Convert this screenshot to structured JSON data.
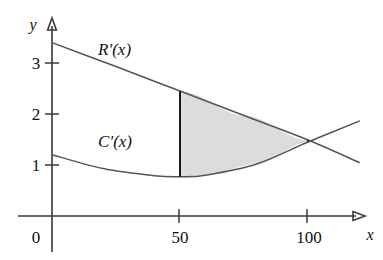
{
  "figure": {
    "title": "",
    "axis_labels": {
      "x": "x",
      "y": "y"
    },
    "origin_label": "0",
    "y_ticks": [
      {
        "value": 1,
        "label": "1"
      },
      {
        "value": 2,
        "label": "2"
      },
      {
        "value": 3,
        "label": "3"
      }
    ],
    "x_ticks": [
      {
        "value": 50,
        "label": "50"
      },
      {
        "value": 100,
        "label": "100"
      }
    ],
    "curve_labels": {
      "revenue": "R′(x)",
      "cost": "C′(x)"
    },
    "shading_color": "#dcdcdc",
    "curve_color": "#555555",
    "axis_color": "#3a3a3a"
  },
  "chart_data": {
    "type": "line",
    "title": "",
    "xlabel": "x",
    "ylabel": "y",
    "xlim": [
      0,
      120
    ],
    "ylim": [
      0,
      4
    ],
    "grid": false,
    "legend": "inline-curve-labels",
    "xticks": [
      0,
      50,
      100
    ],
    "xticklabels": [
      "0",
      "50",
      "100"
    ],
    "yticks": [
      1,
      2,
      3
    ],
    "yticklabels": [
      "1",
      "2",
      "3"
    ],
    "series": [
      {
        "name": "R′(x)",
        "label_position": {
          "x": 18,
          "y": 3.15
        },
        "points": [
          {
            "x": 0,
            "y": 3.4
          },
          {
            "x": 25,
            "y": 2.93
          },
          {
            "x": 50,
            "y": 2.45
          },
          {
            "x": 75,
            "y": 1.97
          },
          {
            "x": 100,
            "y": 1.49
          },
          {
            "x": 120,
            "y": 1.05
          }
        ]
      },
      {
        "name": "C′(x)",
        "label_position": {
          "x": 18,
          "y": 1.35
        },
        "points": [
          {
            "x": 0,
            "y": 1.2
          },
          {
            "x": 20,
            "y": 0.93
          },
          {
            "x": 40,
            "y": 0.79
          },
          {
            "x": 50,
            "y": 0.77
          },
          {
            "x": 60,
            "y": 0.8
          },
          {
            "x": 80,
            "y": 1.02
          },
          {
            "x": 100,
            "y": 1.45
          },
          {
            "x": 120,
            "y": 1.86
          }
        ]
      }
    ],
    "annotations": [
      {
        "type": "shaded-region",
        "between": [
          "R′(x)",
          "C′(x)"
        ],
        "x_from": 50,
        "x_to": 100,
        "color": "#dcdcdc",
        "description": "Region between R′(x) and C′(x) from x = 50 to x = 100"
      },
      {
        "type": "vertical-segment",
        "x": 50,
        "y_from": 0.77,
        "y_to": 2.45,
        "description": "Left boundary of shaded region at x = 50"
      },
      {
        "type": "vertical-segment",
        "x": 100,
        "y_from": 1.45,
        "y_to": 1.49,
        "description": "Right boundary of shaded region at x = 100"
      },
      {
        "type": "intersection",
        "x": 104,
        "y": 1.55,
        "description": "R′(x) and C′(x) cross just past x = 100"
      }
    ]
  }
}
